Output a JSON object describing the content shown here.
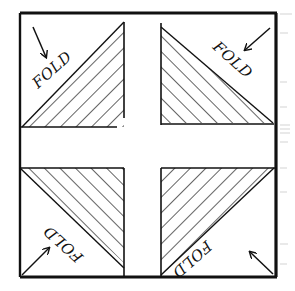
{
  "diagram": {
    "colors": {
      "ink": "#111111",
      "paper": "#ffffff",
      "faint_marks": "#c8c8c8"
    },
    "outer_square": {
      "x": 20,
      "y": 13,
      "width": 256,
      "height": 264
    },
    "quadrants": [
      {
        "id": "top-left",
        "label": "FOLD",
        "square": {
          "x1": 22,
          "y1": 22,
          "x2": 124,
          "y2": 127
        },
        "hatched_half": "bottom-right",
        "arrow_direction": "down-right"
      },
      {
        "id": "top-right",
        "label": "FOLD",
        "square": {
          "x1": 160,
          "y1": 22,
          "x2": 274,
          "y2": 125
        },
        "hatched_half": "bottom-left",
        "arrow_direction": "down-left"
      },
      {
        "id": "bottom-left",
        "label": "FOLD",
        "square": {
          "x1": 20,
          "y1": 167,
          "x2": 124,
          "y2": 276
        },
        "hatched_half": "top-right",
        "arrow_direction": "up-right"
      },
      {
        "id": "bottom-right",
        "label": "FOLD",
        "square": {
          "x1": 160,
          "y1": 167,
          "x2": 275,
          "y2": 276
        },
        "hatched_half": "top-left",
        "arrow_direction": "up-left"
      }
    ],
    "center_cross": "blank"
  }
}
